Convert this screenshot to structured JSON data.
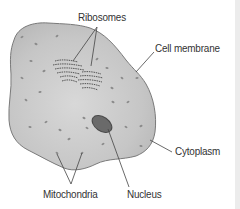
{
  "diagram": {
    "labels": {
      "ribosomes": "Ribosomes",
      "cell_membrane": "Cell membrane",
      "cytoplasm": "Cytoplasm",
      "mitochondria": "Mitochondria",
      "nucleus": "Nucleus"
    },
    "colors": {
      "cell_fill": "#c4c4c4",
      "cell_fill_light": "#d6d6d6",
      "cell_outline": "#7a7a7a",
      "nucleus_fill": "#6a6a6a",
      "nucleus_outline": "#4a4a4a",
      "organelle": "#8a8a8a",
      "leader_line": "#444444",
      "text": "#333333",
      "edge_strip": "#ececec"
    }
  }
}
